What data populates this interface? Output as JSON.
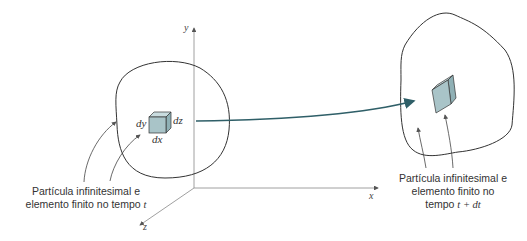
{
  "figure": {
    "axes": {
      "x_label": "x",
      "y_label": "y",
      "z_label": "z"
    },
    "left_element": {
      "dims": {
        "dx": "dx",
        "dy": "dy",
        "dz": "dz"
      },
      "caption_line1": "Partícula infinitesimal e",
      "caption_line2": "elemento finito no tempo ",
      "caption_var": "t"
    },
    "right_element": {
      "caption_line1": "Partícula infinitesimal e",
      "caption_line2": "elemento finito no",
      "caption_line3_prefix": "tempo ",
      "caption_line3_expr": "t + dt"
    },
    "colors": {
      "cube_fill": "#a9c4c8",
      "cube_top": "#c9dcdf",
      "cube_side": "#8fb0b5",
      "arrow": "#2f5f68",
      "outline": "#333333"
    }
  }
}
